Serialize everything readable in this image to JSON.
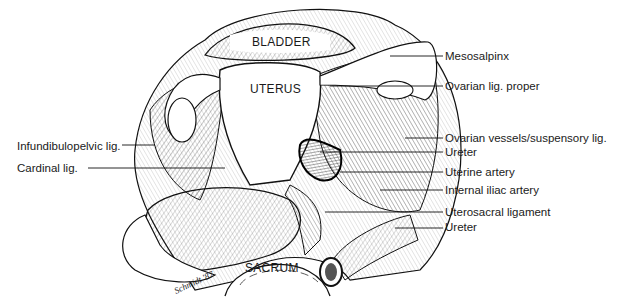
{
  "figure": {
    "organs": {
      "bladder": "BLADDER",
      "uterus": "UTERUS",
      "sacrum": "SACRUM"
    },
    "labels_left": [
      {
        "text": "Infundibulopelvic lig.",
        "x": 17,
        "y": 140
      },
      {
        "text": "Cardinal lig.",
        "x": 17,
        "y": 163
      }
    ],
    "labels_right": [
      {
        "text": "Mesosalpinx",
        "x": 445,
        "y": 50
      },
      {
        "text": "Ovarian lig. proper",
        "x": 445,
        "y": 82
      },
      {
        "text": "Ovarian vessels/suspensory lig.",
        "x": 445,
        "y": 133
      },
      {
        "text": "Ureter",
        "x": 445,
        "y": 150
      },
      {
        "text": "Uterine artery",
        "x": 445,
        "y": 170
      },
      {
        "text": "Internal iliac artery",
        "x": 445,
        "y": 188
      },
      {
        "text": "Uterosacral ligament",
        "x": 445,
        "y": 209
      },
      {
        "text": "Ureter",
        "x": 445,
        "y": 224
      }
    ],
    "signature": "Schmidt '87"
  }
}
